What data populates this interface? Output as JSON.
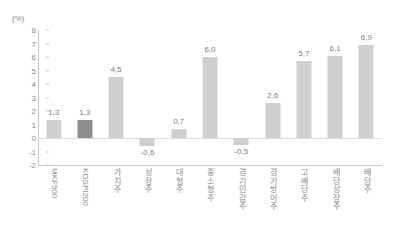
{
  "chart_data": {
    "type": "bar",
    "title": "",
    "subtitle": "",
    "xlabel": "",
    "ylabel": "(%)",
    "unit": "(%)",
    "ylim": [
      -2,
      8
    ],
    "yticks": [
      8,
      7,
      6,
      5,
      4,
      3,
      2,
      1,
      0,
      -1,
      -2
    ],
    "ytick_labels": [
      "8",
      "7",
      "6",
      "5",
      "4",
      "3",
      "2",
      "1",
      "0",
      "-1",
      "-2"
    ],
    "grid": false,
    "legend": null,
    "zero_line": true,
    "categories": [
      "MKF500",
      "KOSPI200",
      "가치주",
      "성장주",
      "대형주",
      "중소형주",
      "경기민감주",
      "경기방어주",
      "고배당주",
      "배당성장주",
      "배당주"
    ],
    "category_scripts": [
      "latin",
      "latin",
      "hangul",
      "hangul",
      "hangul",
      "hangul",
      "hangul",
      "hangul",
      "hangul",
      "hangul",
      "hangul"
    ],
    "values": [
      1.3,
      1.3,
      4.5,
      -0.6,
      0.7,
      6.0,
      -0.5,
      2.6,
      5.7,
      6.1,
      6.9
    ],
    "value_labels": [
      "1,3",
      "1,3",
      "4,5",
      "-0,6",
      "0,7",
      "6,0",
      "-0,5",
      "2,6",
      "5,7",
      "6,1",
      "6,9"
    ],
    "highlight_index": 1,
    "colors": {
      "bar": "#cfcfcf",
      "bar_highlight": "#8f8f8f",
      "axis": "#c9c9c9",
      "zero_line": "#dcdcdc",
      "text": "#8a8a8a",
      "value_text": "#7d7d7d",
      "background": "#ffffff"
    }
  }
}
